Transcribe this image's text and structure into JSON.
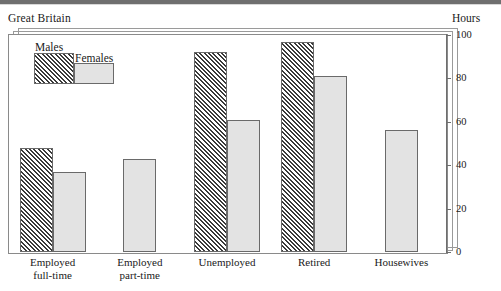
{
  "header": {
    "title": "Great Britain",
    "units_label": "Hours"
  },
  "legend": {
    "males_label": "Males",
    "females_label": "Females"
  },
  "axis": {
    "tick_labels": [
      "0",
      "20",
      "40",
      "60",
      "80",
      "100"
    ]
  },
  "categories": [
    "Employed\nfull-time",
    "Employed\npart-time",
    "Unemployed",
    "Retired",
    "Housewives"
  ],
  "colors": {
    "males_hatch": "#3a3a3a",
    "females_fill": "#e3e3e3",
    "frame": "#9a9a9a",
    "axis": "#6e6e6e",
    "background": "#ffffff"
  },
  "chart_data": {
    "type": "bar",
    "title": "Great Britain",
    "xlabel": "",
    "ylabel": "Hours",
    "ylim": [
      0,
      100
    ],
    "yticks": [
      0,
      20,
      40,
      60,
      80,
      100
    ],
    "grid": false,
    "legend_position": "top-left",
    "categories": [
      "Employed full-time",
      "Employed part-time",
      "Unemployed",
      "Retired",
      "Housewives"
    ],
    "series": [
      {
        "name": "Males",
        "values": [
          48,
          null,
          92,
          97,
          null
        ]
      },
      {
        "name": "Females",
        "values": [
          37,
          43,
          61,
          81,
          56
        ]
      }
    ]
  }
}
